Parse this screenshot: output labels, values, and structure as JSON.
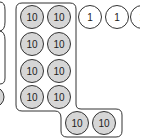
{
  "colors": {
    "ten_fill": "#d6d6d6",
    "one_fill": "#ffffff",
    "stroke": "#333333",
    "container_stroke": "#333333"
  },
  "tens": {
    "label": "10",
    "coins": [
      {
        "cx": 32,
        "cy": 17
      },
      {
        "cx": 59,
        "cy": 17
      },
      {
        "cx": 32,
        "cy": 44
      },
      {
        "cx": 59,
        "cy": 44
      },
      {
        "cx": 32,
        "cy": 71
      },
      {
        "cx": 59,
        "cy": 71
      },
      {
        "cx": 32,
        "cy": 97
      },
      {
        "cx": 59,
        "cy": 97
      },
      {
        "cx": 77,
        "cy": 123
      },
      {
        "cx": 104,
        "cy": 123
      }
    ]
  },
  "ones": {
    "label": "1",
    "coins": [
      {
        "cx": 90,
        "cy": 17
      },
      {
        "cx": 117,
        "cy": 17
      },
      {
        "cx": 142,
        "cy": 17
      }
    ]
  }
}
